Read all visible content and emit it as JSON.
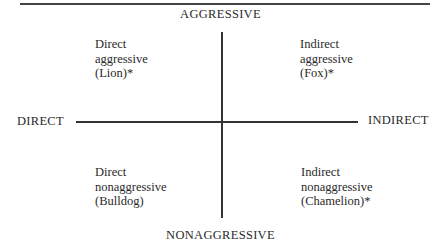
{
  "diagram": {
    "type": "quadrant",
    "axes": {
      "vertical": {
        "top": "AGGRESSIVE",
        "bottom": "NONAGGRESSIVE"
      },
      "horizontal": {
        "left": "DIRECT",
        "right": "INDIRECT"
      }
    },
    "quadrants": {
      "top_left": {
        "line1": "Direct",
        "line2": "aggressive",
        "line3": "(Lion)*"
      },
      "top_right": {
        "line1": "Indirect",
        "line2": "aggressive",
        "line3": "(Fox)*"
      },
      "bottom_left": {
        "line1": "Direct",
        "line2": "nonaggressive",
        "line3": "(Bulldog)"
      },
      "bottom_right": {
        "line1": "Indirect",
        "line2": "nonaggressive",
        "line3": "(Chamelion)*"
      }
    },
    "colors": {
      "line": "#333333",
      "text": "#2a2a2a",
      "background": "#ffffff"
    }
  }
}
